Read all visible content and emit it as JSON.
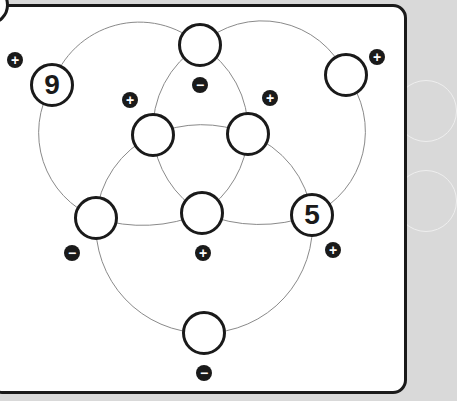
{
  "puzzle": {
    "nodes": [
      {
        "id": "top-center",
        "value": "",
        "x": 200,
        "y": 45
      },
      {
        "id": "top-left",
        "value": "9",
        "x": 52,
        "y": 85
      },
      {
        "id": "top-right",
        "value": "",
        "x": 346,
        "y": 75
      },
      {
        "id": "inner-upper-left",
        "value": "",
        "x": 153,
        "y": 135
      },
      {
        "id": "inner-upper-right",
        "value": "",
        "x": 248,
        "y": 134
      },
      {
        "id": "lower-left",
        "value": "",
        "x": 96,
        "y": 218
      },
      {
        "id": "lower-center",
        "value": "",
        "x": 202,
        "y": 213
      },
      {
        "id": "lower-right",
        "value": "5",
        "x": 312,
        "y": 215
      },
      {
        "id": "bottom",
        "value": "",
        "x": 204,
        "y": 333
      }
    ],
    "signs": [
      {
        "symbol": "+",
        "x": 15,
        "y": 60
      },
      {
        "symbol": "−",
        "x": 200,
        "y": 85
      },
      {
        "symbol": "+",
        "x": 130,
        "y": 100
      },
      {
        "symbol": "+",
        "x": 270,
        "y": 98
      },
      {
        "symbol": "+",
        "x": 377,
        "y": 57
      },
      {
        "symbol": "−",
        "x": 72,
        "y": 253
      },
      {
        "symbol": "+",
        "x": 203,
        "y": 253
      },
      {
        "symbol": "+",
        "x": 333,
        "y": 250
      },
      {
        "symbol": "−",
        "x": 204,
        "y": 373
      }
    ]
  }
}
